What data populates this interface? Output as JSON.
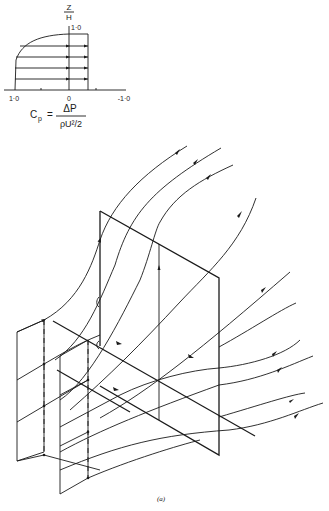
{
  "inset_profile": {
    "y_axis_label_top": "Z",
    "y_axis_label_bottom": "H",
    "y_axis_tick": "1·0",
    "x_tick_labels": [
      "1·0",
      "0",
      "-1·0"
    ],
    "formula": {
      "lhs": "C",
      "lhs_sub": "p",
      "numerator": "ΔP",
      "denominator": "ρU²/2"
    },
    "profile_arrows_count": 5
  },
  "main_figure": {
    "caption": "(a)",
    "description": "Streamlines flowing past a flat plate with secondary planes"
  }
}
